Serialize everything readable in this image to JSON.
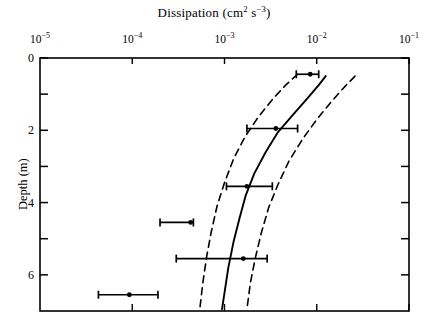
{
  "chart_data": {
    "type": "scatter",
    "title_parts": {
      "name": "Dissipation",
      "units_main": "(cm",
      "units_sup1": "2",
      "units_mid": " s",
      "units_sup2": "−3",
      "units_close": ")"
    },
    "xlabel": "Dissipation (cm^2 s^-3)",
    "ylabel": "Depth (m)",
    "xscale": "log",
    "xlim": [
      1e-05,
      0.1
    ],
    "ylim": [
      0,
      7
    ],
    "y_inverted": true,
    "x_axis_position": "top",
    "grid": false,
    "legend": null,
    "xticks": [
      {
        "value": 1e-05,
        "mantissa": "10",
        "exponent": "−5"
      },
      {
        "value": 0.0001,
        "mantissa": "10",
        "exponent": "−4"
      },
      {
        "value": 0.001,
        "mantissa": "10",
        "exponent": "−3"
      },
      {
        "value": 0.01,
        "mantissa": "10",
        "exponent": "−2"
      },
      {
        "value": 0.1,
        "mantissa": "10",
        "exponent": "−1"
      }
    ],
    "yticks_major": [
      {
        "value": 0,
        "label": "0"
      },
      {
        "value": 2,
        "label": "2"
      },
      {
        "value": 4,
        "label": "4"
      },
      {
        "value": 6,
        "label": "6"
      }
    ],
    "yticks_minor": [
      1,
      3,
      5
    ],
    "points": [
      {
        "x": 0.0085,
        "y": 0.45,
        "xerr_low": 0.006,
        "xerr_high": 0.0105
      },
      {
        "x": 0.0036,
        "y": 1.95,
        "xerr_low": 0.00175,
        "xerr_high": 0.0062
      },
      {
        "x": 0.00175,
        "y": 3.55,
        "xerr_low": 0.00105,
        "xerr_high": 0.0033
      },
      {
        "x": 0.00043,
        "y": 4.55,
        "xerr_low": 0.0002,
        "xerr_high": 0.00046
      },
      {
        "x": 0.0016,
        "y": 5.55,
        "xerr_low": 0.0003,
        "xerr_high": 0.0029
      },
      {
        "x": 9.3e-05,
        "y": 6.55,
        "xerr_low": 4.3e-05,
        "xerr_high": 0.00019
      }
    ],
    "series": [
      {
        "name": "median profile",
        "style": "solid",
        "points": [
          {
            "x": 0.0125,
            "y": 0.5
          },
          {
            "x": 0.0105,
            "y": 0.75
          },
          {
            "x": 0.008,
            "y": 1.1
          },
          {
            "x": 0.0056,
            "y": 1.55
          },
          {
            "x": 0.0038,
            "y": 2.05
          },
          {
            "x": 0.0028,
            "y": 2.6
          },
          {
            "x": 0.0021,
            "y": 3.2
          },
          {
            "x": 0.0017,
            "y": 3.8
          },
          {
            "x": 0.00145,
            "y": 4.45
          },
          {
            "x": 0.00125,
            "y": 5.1
          },
          {
            "x": 0.0011,
            "y": 5.8
          },
          {
            "x": 0.001,
            "y": 6.5
          },
          {
            "x": 0.00094,
            "y": 6.95
          }
        ]
      },
      {
        "name": "lower confidence bound",
        "style": "dashed",
        "points": [
          {
            "x": 0.0062,
            "y": 0.45
          },
          {
            "x": 0.0046,
            "y": 0.75
          },
          {
            "x": 0.0033,
            "y": 1.15
          },
          {
            "x": 0.0023,
            "y": 1.65
          },
          {
            "x": 0.00165,
            "y": 2.2
          },
          {
            "x": 0.00125,
            "y": 2.8
          },
          {
            "x": 0.001,
            "y": 3.45
          },
          {
            "x": 0.00083,
            "y": 4.1
          },
          {
            "x": 0.00072,
            "y": 4.8
          },
          {
            "x": 0.00064,
            "y": 5.5
          },
          {
            "x": 0.00058,
            "y": 6.25
          },
          {
            "x": 0.00054,
            "y": 6.95
          }
        ]
      },
      {
        "name": "upper confidence bound",
        "style": "dashed",
        "points": [
          {
            "x": 0.026,
            "y": 0.5
          },
          {
            "x": 0.02,
            "y": 0.8
          },
          {
            "x": 0.0145,
            "y": 1.2
          },
          {
            "x": 0.01,
            "y": 1.7
          },
          {
            "x": 0.007,
            "y": 2.25
          },
          {
            "x": 0.005,
            "y": 2.85
          },
          {
            "x": 0.0038,
            "y": 3.5
          },
          {
            "x": 0.003,
            "y": 4.15
          },
          {
            "x": 0.0025,
            "y": 4.85
          },
          {
            "x": 0.00215,
            "y": 5.55
          },
          {
            "x": 0.0019,
            "y": 6.25
          },
          {
            "x": 0.00175,
            "y": 6.95
          }
        ]
      }
    ],
    "colors": {
      "line": "#000000",
      "marker": "#000000",
      "axis": "#000000",
      "background": "#ffffff"
    }
  }
}
